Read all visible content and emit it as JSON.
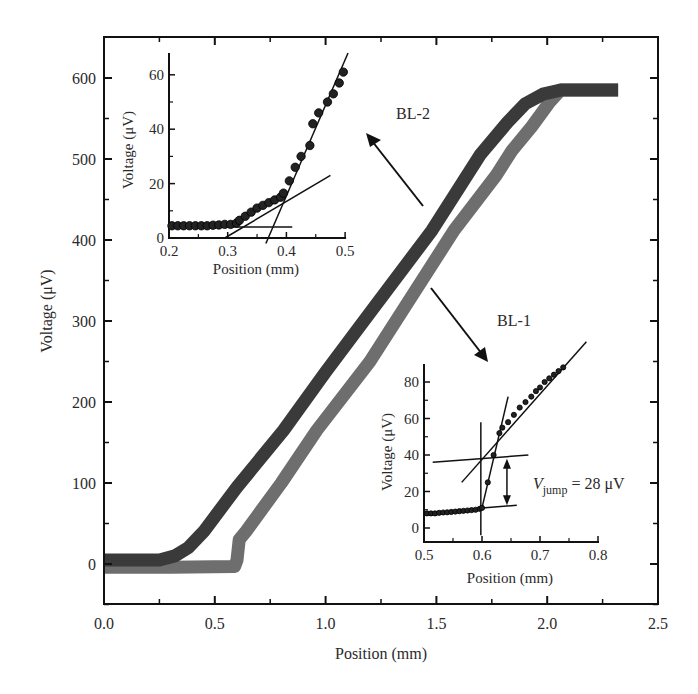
{
  "chart_data": [
    {
      "id": "main",
      "type": "line",
      "title": "",
      "xlabel": "Position (mm)",
      "ylabel": "Voltage (μV)",
      "xlim": [
        0.0,
        2.5
      ],
      "ylim": [
        -50,
        650
      ],
      "xticks": [
        "0.0",
        "0.5",
        "1.0",
        "1.5",
        "2.0",
        "2.5"
      ],
      "xtick_values": [
        0.0,
        0.5,
        1.0,
        1.5,
        2.0,
        2.5
      ],
      "xminor": [
        0.25,
        0.75,
        1.25,
        1.75,
        2.25
      ],
      "yticks": [
        "0",
        "100",
        "200",
        "300",
        "400",
        "500",
        "600"
      ],
      "ytick_values": [
        0,
        100,
        200,
        300,
        400,
        500,
        600
      ],
      "yminor": [
        -50,
        50,
        150,
        250,
        350,
        450,
        550
      ],
      "grid": false,
      "legend": null,
      "series": [
        {
          "name": "BL-2",
          "color": "#3a3a3a",
          "x": [
            0.0,
            0.25,
            0.32,
            0.38,
            0.45,
            0.6,
            0.81,
            1.0,
            1.2,
            1.48,
            1.7,
            1.82,
            1.9,
            1.98,
            2.06,
            2.32
          ],
          "y": [
            5,
            5,
            10,
            20,
            40,
            95,
            165,
            237,
            310,
            412,
            506,
            545,
            568,
            580,
            585,
            585
          ]
        },
        {
          "name": "BL-1",
          "color": "#6e6e6e",
          "x": [
            0.0,
            0.3,
            0.59,
            0.6,
            0.61,
            0.64,
            0.8,
            0.96,
            1.2,
            1.58,
            1.77,
            1.84,
            1.93,
            2.01,
            2.06,
            2.32
          ],
          "y": [
            -4,
            -4,
            -3,
            5,
            30,
            40,
            100,
            165,
            250,
            412,
            480,
            510,
            540,
            570,
            585,
            585
          ]
        }
      ],
      "annotations": [
        {
          "text": "BL-2",
          "x": 1.4,
          "y": 555
        },
        {
          "text": "BL-1",
          "x": 1.83,
          "y": 300
        }
      ]
    },
    {
      "id": "inset-bl2",
      "type": "scatter",
      "xlabel": "Position (mm)",
      "ylabel": "Voltage (μV)",
      "xlim": [
        0.2,
        0.5
      ],
      "ylim": [
        0,
        68
      ],
      "xticks": [
        "0.2",
        "0.3",
        "0.4",
        "0.5"
      ],
      "xtick_values": [
        0.2,
        0.3,
        0.4,
        0.5
      ],
      "yticks": [
        "0",
        "20",
        "40",
        "60"
      ],
      "ytick_values": [
        0,
        20,
        40,
        60
      ],
      "points": {
        "x": [
          0.205,
          0.215,
          0.225,
          0.235,
          0.245,
          0.255,
          0.265,
          0.275,
          0.285,
          0.295,
          0.305,
          0.315,
          0.32,
          0.33,
          0.34,
          0.35,
          0.36,
          0.37,
          0.38,
          0.39,
          0.395,
          0.405,
          0.415,
          0.425,
          0.44,
          0.445,
          0.455,
          0.47,
          0.48,
          0.49,
          0.497
        ],
        "y": [
          4.5,
          4.5,
          4.5,
          4.5,
          4.5,
          4.5,
          4.5,
          4.7,
          4.8,
          5,
          5,
          5.5,
          6.5,
          8,
          9.5,
          11,
          12,
          13,
          14,
          15,
          16.5,
          21,
          26,
          30,
          34,
          42,
          46,
          50,
          53,
          57,
          61
        ]
      },
      "fit_lines": [
        {
          "x": [
            0.2,
            0.41
          ],
          "y": [
            4,
            4
          ]
        },
        {
          "x": [
            0.295,
            0.475
          ],
          "y": [
            0,
            23
          ]
        },
        {
          "x": [
            0.365,
            0.505
          ],
          "y": [
            -2,
            68
          ]
        }
      ]
    },
    {
      "id": "inset-bl1",
      "type": "scatter",
      "xlabel": "Position (mm)",
      "ylabel": "Voltage (μV)",
      "xlim": [
        0.5,
        0.8
      ],
      "ylim": [
        -8,
        90
      ],
      "xticks": [
        "0.5",
        "0.6",
        "0.7",
        "0.8"
      ],
      "xtick_values": [
        0.5,
        0.6,
        0.7,
        0.8
      ],
      "yticks": [
        "0",
        "20",
        "40",
        "60",
        "80"
      ],
      "ytick_values": [
        0,
        20,
        40,
        60,
        80
      ],
      "points": {
        "x": [
          0.505,
          0.512,
          0.519,
          0.526,
          0.533,
          0.54,
          0.547,
          0.554,
          0.561,
          0.568,
          0.575,
          0.582,
          0.589,
          0.596,
          0.6,
          0.61,
          0.62,
          0.63,
          0.635,
          0.645,
          0.655,
          0.665,
          0.675,
          0.685,
          0.693,
          0.7,
          0.708,
          0.716,
          0.724,
          0.732,
          0.74
        ],
        "y": [
          8,
          8,
          8,
          8.3,
          8.5,
          8.6,
          8.8,
          9,
          9.2,
          9.4,
          9.6,
          9.8,
          10,
          10.5,
          11,
          25,
          40,
          52,
          55,
          58,
          62,
          66,
          69,
          72,
          75,
          77,
          80,
          82,
          84,
          86,
          88
        ]
      },
      "fit_lines": [
        {
          "x": [
            0.598,
            0.598
          ],
          "y": [
            -4,
            58
          ]
        },
        {
          "x": [
            0.515,
            0.68
          ],
          "y": [
            36,
            40
          ]
        },
        {
          "x": [
            0.6,
            0.66
          ],
          "y": [
            11,
            12.5
          ]
        },
        {
          "x": [
            0.6,
            0.645
          ],
          "y": [
            11,
            72
          ]
        },
        {
          "x": [
            0.565,
            0.78
          ],
          "y": [
            25,
            102
          ]
        }
      ],
      "jump_arrow": {
        "x": 0.643,
        "y_from": 12.5,
        "y_to": 38
      },
      "annotation": {
        "prefix": "V",
        "subscript": "jump",
        "suffix": " = 28 μV",
        "value_uV": 28
      }
    }
  ],
  "labels": {
    "main_xlabel": "Position (mm)",
    "main_ylabel": "Voltage (μV)",
    "bl2_label": "BL-2",
    "bl1_label": "BL-1",
    "inset_xlabel": "Position (mm)",
    "inset_ylabel": "Voltage (μV)",
    "vjump_v": "V",
    "vjump_sub": "jump",
    "vjump_rest": " = 28 μV"
  }
}
